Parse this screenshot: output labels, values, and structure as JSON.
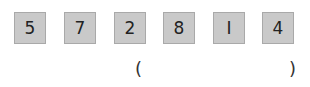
{
  "cards": [
    "5",
    "7",
    "2",
    "8",
    "I",
    "4"
  ],
  "answer": {
    "open": "(",
    "close": ")",
    "value": ""
  }
}
